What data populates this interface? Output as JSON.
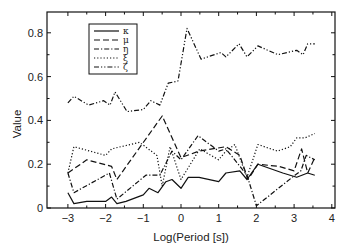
{
  "chart_data": {
    "type": "line",
    "title": "",
    "xlabel": "Log(Period [s])",
    "ylabel": "Value",
    "xlim": [
      -3.3,
      4
    ],
    "ylim": [
      0,
      0.9
    ],
    "xticks": [
      -3,
      -2,
      -1,
      0,
      1,
      2,
      3,
      4
    ],
    "xtick_labels": [
      "−3",
      "−2",
      "−1",
      "0",
      "1",
      "2",
      "3",
      "4"
    ],
    "yticks": [
      0,
      0.2,
      0.4,
      0.6,
      0.8
    ],
    "ytick_labels": [
      "0",
      "0.2",
      "0.4",
      "0.6",
      "0.8"
    ],
    "grid": false,
    "legend_position": "upper left",
    "series": [
      {
        "name": "κ",
        "style": "solid",
        "x": [
          -3.0,
          -2.84,
          -2.5,
          -2.0,
          -1.84,
          -1.7,
          -1.46,
          -1.0,
          -0.85,
          -0.61,
          -0.4,
          -0.24,
          0.0,
          0.19,
          0.48,
          1.0,
          1.19,
          1.56,
          1.75,
          2.04,
          2.7,
          3.07,
          3.36,
          3.55
        ],
        "y": [
          0.07,
          0.02,
          0.03,
          0.03,
          0.05,
          0.02,
          0.03,
          0.06,
          0.09,
          0.07,
          0.12,
          0.13,
          0.09,
          0.14,
          0.14,
          0.12,
          0.16,
          0.17,
          0.13,
          0.2,
          0.16,
          0.14,
          0.16,
          0.15
        ]
      },
      {
        "name": "μ",
        "style": "dashed",
        "x": [
          -3.0,
          -2.5,
          -1.84,
          -1.7,
          -1.33,
          -0.5,
          0.0,
          0.48,
          1.19,
          1.56,
          1.78,
          2.04,
          2.6,
          3.0,
          3.2,
          3.36,
          3.55
        ],
        "y": [
          0.16,
          0.22,
          0.19,
          0.13,
          0.22,
          0.42,
          0.23,
          0.26,
          0.28,
          0.24,
          0.13,
          0.2,
          0.19,
          0.17,
          0.27,
          0.16,
          0.23
        ]
      },
      {
        "name": "η",
        "style": "dashdot",
        "x": [
          -3.0,
          -2.84,
          -1.9,
          -1.7,
          -0.93,
          -0.56,
          -0.24,
          0.0,
          0.45,
          1.0,
          1.19,
          1.75,
          2.0,
          3.02,
          3.18,
          3.32,
          3.55
        ],
        "y": [
          0.16,
          0.07,
          0.16,
          0.04,
          0.15,
          0.15,
          0.26,
          0.22,
          0.33,
          0.26,
          0.27,
          0.15,
          0.01,
          0.15,
          0.17,
          0.24,
          0.22
        ]
      },
      {
        "name": "ξ",
        "style": "dotted",
        "x": [
          -3.0,
          -2.84,
          -2.0,
          -1.84,
          -1.1,
          -0.64,
          -0.5,
          -0.29,
          0.0,
          0.5,
          1.0,
          1.19,
          1.43,
          1.75,
          2.04,
          2.56,
          2.9,
          3.07,
          3.29,
          3.55
        ],
        "y": [
          0.16,
          0.28,
          0.24,
          0.27,
          0.3,
          0.24,
          0.1,
          0.28,
          0.13,
          0.27,
          0.22,
          0.26,
          0.29,
          0.14,
          0.29,
          0.26,
          0.28,
          0.32,
          0.32,
          0.34
        ]
      },
      {
        "name": "ζ",
        "style": "dashdotdot",
        "x": [
          -3.0,
          -2.84,
          -2.45,
          -2.05,
          -1.88,
          -1.75,
          -1.43,
          -1.0,
          -0.8,
          -0.56,
          -0.34,
          -0.08,
          0.16,
          0.53,
          1.06,
          1.19,
          1.54,
          1.75,
          2.04,
          2.57,
          3.07,
          3.24,
          3.36,
          3.55
        ],
        "y": [
          0.48,
          0.51,
          0.47,
          0.49,
          0.47,
          0.53,
          0.44,
          0.45,
          0.49,
          0.47,
          0.57,
          0.58,
          0.82,
          0.68,
          0.71,
          0.69,
          0.75,
          0.69,
          0.74,
          0.7,
          0.72,
          0.7,
          0.75,
          0.75
        ]
      }
    ]
  }
}
